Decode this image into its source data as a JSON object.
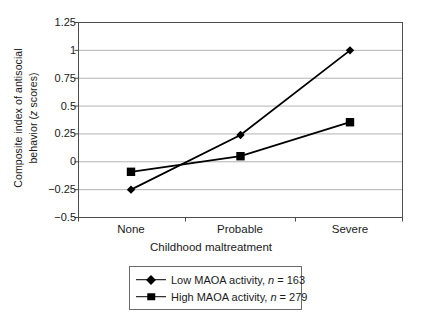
{
  "chart_data": {
    "type": "line",
    "title": "",
    "xlabel": "Childhood maltreatment",
    "ylabel_line1": "Composite index of antisocial",
    "ylabel_line2": "behavior (z scores)",
    "categories": [
      "None",
      "Probable",
      "Severe"
    ],
    "ylim": [
      -0.5,
      1.25
    ],
    "yticks": [
      "1.25",
      "1",
      "0.75",
      "0.5",
      "0.25",
      "0",
      "−0.25",
      "−0.5"
    ],
    "ytick_values": [
      1.25,
      1,
      0.75,
      0.5,
      0.25,
      0,
      -0.25,
      -0.5
    ],
    "grid": true,
    "legend_position": "bottom",
    "series": [
      {
        "name": "Low MAOA activity, n = 163",
        "label_text": "Low MAOA activity, ",
        "label_italic": "n",
        "label_tail": " = 163",
        "marker": "diamond",
        "color": "#000000",
        "values": [
          -0.25,
          0.24,
          1.0
        ]
      },
      {
        "name": "High MAOA activity, n = 279",
        "label_text": "High MAOA activity, ",
        "label_italic": "n",
        "label_tail": " = 279",
        "marker": "square",
        "color": "#000000",
        "values": [
          -0.09,
          0.05,
          0.355
        ]
      }
    ]
  },
  "axis": {
    "ylabel_italic": "z",
    "ylabel_pre": "behavior (",
    "ylabel_post": " scores)"
  },
  "colors": {
    "axis": "#4d4d4d",
    "grid": "#b3b3b3",
    "series": "#000000",
    "legend_border": "#6b6b6b",
    "background": "#ffffff"
  }
}
